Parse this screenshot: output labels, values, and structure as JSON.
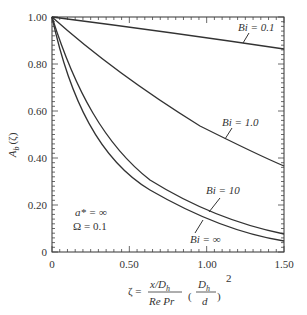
{
  "chart_data": {
    "type": "line",
    "title": "",
    "xlabel": "ζ = (x/D_h)/(Re Pr) · (D_h/d)^2",
    "ylabel": "A_b (ζ)",
    "xlim": [
      0,
      1.5
    ],
    "ylim": [
      0,
      1.0
    ],
    "grid": false,
    "x_ticks": [
      "0",
      "0.50",
      "1.00",
      "1.50"
    ],
    "y_ticks": [
      "0",
      "0.20",
      "0.40",
      "0.60",
      "0.80",
      "1.00"
    ],
    "x": [
      0,
      0.1,
      0.25,
      0.5,
      0.75,
      1.0,
      1.25,
      1.5
    ],
    "series": [
      {
        "name": "Bi = 0.1",
        "values": [
          1.0,
          0.99,
          0.977,
          0.955,
          0.932,
          0.91,
          0.887,
          0.864
        ]
      },
      {
        "name": "Bi = 1.0",
        "values": [
          1.0,
          0.935,
          0.845,
          0.72,
          0.61,
          0.515,
          0.435,
          0.366
        ]
      },
      {
        "name": "Bi = 10",
        "values": [
          1.0,
          0.82,
          0.62,
          0.385,
          0.26,
          0.175,
          0.118,
          0.077
        ]
      },
      {
        "name": "Bi = ∞",
        "values": [
          1.0,
          0.78,
          0.57,
          0.335,
          0.22,
          0.15,
          0.095,
          0.047
        ]
      }
    ],
    "annotations": [
      "a* = ∞",
      "Ω = 0.1"
    ]
  },
  "labels": {
    "y_axis": "A",
    "y_axis_sub": "b",
    "y_axis_arg": "(ζ)",
    "x_axis_zeta": "ζ =",
    "x_axis_num": "x/D",
    "x_axis_num_sub": "h",
    "x_axis_den": "Re Pr",
    "x_axis_paren_num": "D",
    "x_axis_paren_num_sub": "h",
    "x_axis_paren_den": "d",
    "x_axis_exp": "2",
    "bi01": "Bi = 0.1",
    "bi1": "Bi = 1.0",
    "bi10": "Bi = 10",
    "biinf": "Bi = ∞",
    "annot1": "a* = ∞",
    "annot2": "Ω = 0.1"
  },
  "ticks": {
    "x": [
      "0",
      "0.50",
      "1.00",
      "1.50"
    ],
    "y": [
      "0",
      "0.20",
      "0.40",
      "0.60",
      "0.80",
      "1.00"
    ]
  }
}
